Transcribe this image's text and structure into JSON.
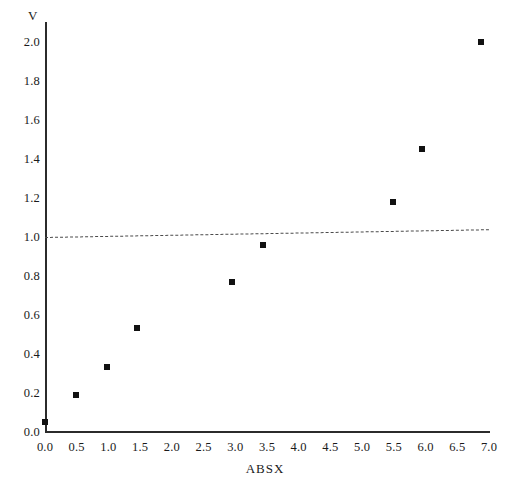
{
  "chart_data": {
    "type": "scatter",
    "title": "",
    "xlabel": "ABSX",
    "ylabel": "V",
    "xlim": [
      0.0,
      7.0
    ],
    "ylim": [
      0.0,
      2.0
    ],
    "xticks": [
      "0.0",
      "0.5",
      "1.0",
      "1.5",
      "2.0",
      "2.5",
      "3.0",
      "3.5",
      "4.0",
      "4.5",
      "5.0",
      "5.5",
      "6.0",
      "6.5",
      "7.0"
    ],
    "xtick_values": [
      0.0,
      0.5,
      1.0,
      1.5,
      2.0,
      2.5,
      3.0,
      3.5,
      4.0,
      4.5,
      5.0,
      5.5,
      6.0,
      6.5,
      7.0
    ],
    "yticks": [
      "0.0",
      "0.2",
      "0.4",
      "0.6",
      "0.8",
      "1.0",
      "1.2",
      "1.4",
      "1.6",
      "1.8",
      "2.0"
    ],
    "ytick_values": [
      0.0,
      0.2,
      0.4,
      0.6,
      0.8,
      1.0,
      1.2,
      1.4,
      1.6,
      1.8,
      2.0
    ],
    "minor_tick_step_x": 0.1,
    "minor_tick_step_y": 0.04,
    "grid": false,
    "legend": null,
    "marker": "filled-square",
    "marker_color": "#111111",
    "x": [
      0.0,
      0.49,
      0.98,
      1.45,
      2.95,
      3.44,
      5.48,
      5.95,
      6.88
    ],
    "y": [
      0.05,
      0.19,
      0.33,
      0.53,
      0.77,
      0.96,
      1.18,
      1.45,
      2.0
    ],
    "points": [
      {
        "x": 0.0,
        "y": 0.05
      },
      {
        "x": 0.49,
        "y": 0.19
      },
      {
        "x": 0.98,
        "y": 0.33
      },
      {
        "x": 1.45,
        "y": 0.53
      },
      {
        "x": 2.95,
        "y": 0.77
      },
      {
        "x": 3.44,
        "y": 0.96
      },
      {
        "x": 5.48,
        "y": 1.18
      },
      {
        "x": 5.95,
        "y": 1.45
      },
      {
        "x": 6.88,
        "y": 2.0
      }
    ],
    "reference_line": {
      "style": "dashed",
      "color": "#4a4a4a",
      "x0": 0.0,
      "y0": 1.0,
      "x1": 7.0,
      "y1": 1.04
    }
  }
}
